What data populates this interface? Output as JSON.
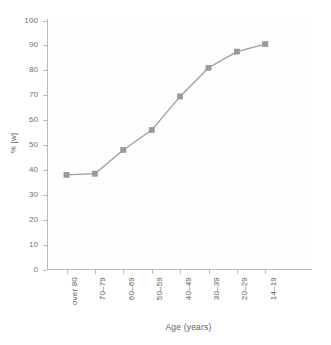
{
  "chart_data": {
    "type": "line",
    "title": "",
    "xlabel": "Age (years)",
    "ylabel": "% [w]",
    "categories": [
      "over 80",
      "70–79",
      "60–69",
      "50–59",
      "40–49",
      "30–39",
      "20–29",
      "14–19"
    ],
    "values": [
      38,
      38.5,
      48,
      56,
      69.5,
      81,
      87.5,
      90.5
    ],
    "ylim": [
      0,
      100
    ],
    "ytick_labels": [
      "100",
      "90",
      "80",
      "70",
      "60",
      "50",
      "40",
      "30",
      "20",
      "10",
      "0"
    ],
    "ytick_values": [
      100,
      90,
      80,
      70,
      60,
      50,
      40,
      30,
      20,
      10,
      0
    ],
    "grid": false,
    "legend": false,
    "series_color": "#9d9d9d",
    "marker_color": "#9a9a9a",
    "axis_color": "#b9b9b9",
    "text_color": "#5e5e5e",
    "background": "#ffffff"
  }
}
